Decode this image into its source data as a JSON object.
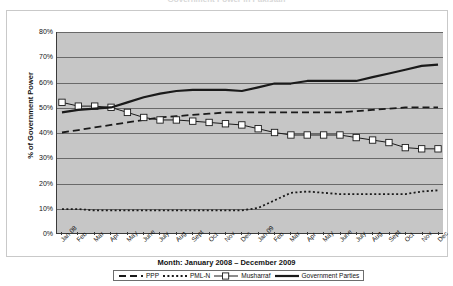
{
  "title": "Government Power in Pakistan",
  "axis": {
    "y_title": "% of Government Power",
    "x_title": "Month: January 2008 – December 2009",
    "y_ticks": [
      "80%",
      "70%",
      "60%",
      "50%",
      "40%",
      "30%",
      "20%",
      "10%",
      "0%"
    ]
  },
  "legend": {
    "items": [
      {
        "label": "PPP",
        "style": "dashed",
        "color": "#1a1a1a",
        "marker": "none"
      },
      {
        "label": "PML-N",
        "style": "dotted",
        "color": "#1a1a1a",
        "marker": "none"
      },
      {
        "label": "Musharraf",
        "style": "solid-square",
        "color": "#1a1a1a",
        "marker": "square"
      },
      {
        "label": "Government Parties",
        "style": "solid-thick",
        "color": "#1a1a1a",
        "marker": "none"
      }
    ]
  },
  "chart_data": {
    "type": "line",
    "title": "Government Power in Pakistan",
    "xlabel": "Month: January 2008 – December 2009",
    "ylabel": "% of Government Power",
    "ylim": [
      0,
      80
    ],
    "grid": true,
    "legend_position": "bottom",
    "categories": [
      "Jan 08",
      "Feb",
      "Mar",
      "Apr",
      "May",
      "June",
      "July",
      "Aug",
      "Sept",
      "Oct",
      "Nov",
      "Dec",
      "Jan 09",
      "Feb",
      "Mar",
      "Apr",
      "May",
      "June",
      "July",
      "Aug",
      "Sept",
      "Oct",
      "Nov",
      "Dec"
    ],
    "series": [
      {
        "name": "PPP",
        "style": "dashed",
        "values": [
          40,
          41,
          42,
          43,
          44,
          45,
          46,
          46.5,
          47,
          47.5,
          48,
          48,
          48,
          48,
          48,
          48,
          48,
          48,
          48.5,
          49,
          49.5,
          50,
          50,
          50
        ]
      },
      {
        "name": "PML-N",
        "style": "dotted",
        "values": [
          9.5,
          9.5,
          9,
          9,
          9,
          9,
          9,
          9,
          9,
          9,
          9,
          9,
          10,
          13,
          16,
          16.5,
          16,
          15.5,
          15.5,
          15.5,
          15.5,
          15.5,
          16.5,
          17
        ]
      },
      {
        "name": "Musharraf",
        "style": "solid-square",
        "values": [
          52,
          50.5,
          50.5,
          50,
          48,
          46,
          45,
          45,
          44.5,
          44,
          43.5,
          43,
          41.5,
          40,
          39,
          39,
          39,
          39,
          38,
          37,
          36,
          34,
          33.5,
          33.5
        ]
      },
      {
        "name": "Government Parties",
        "style": "solid-thick",
        "values": [
          48,
          49,
          49.5,
          50,
          52,
          54,
          55.5,
          56.5,
          57,
          57,
          57,
          56.5,
          58,
          59.5,
          59.5,
          60.5,
          60.5,
          60.5,
          60.5,
          62,
          63.5,
          65,
          66.5,
          67
        ]
      }
    ]
  }
}
